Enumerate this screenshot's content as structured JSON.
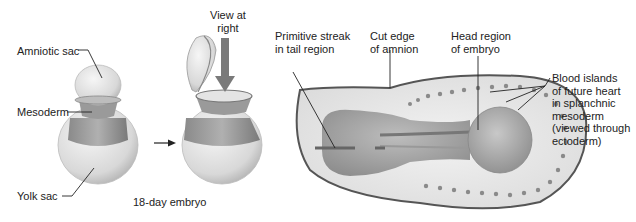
{
  "figure": {
    "left_panel": {
      "labels": {
        "amniotic_sac": "Amniotic sac",
        "mesoderm": "Mesoderm",
        "yolk_sac": "Yolk sac"
      },
      "caption": "18-day embryo",
      "view_label_line1": "View at",
      "view_label_line2": "right"
    },
    "right_panel": {
      "labels": {
        "primitive_streak_line1": "Primitive streak",
        "primitive_streak_line2": "in tail region",
        "cut_edge_line1": "Cut edge",
        "cut_edge_line2": "of amnion",
        "head_region_line1": "Head region",
        "head_region_line2": "of embryo",
        "blood_islands_line1": "Blood islands",
        "blood_islands_line2": "of future heart",
        "blood_islands_line3": "in splanchnic",
        "blood_islands_line4": "mesoderm",
        "blood_islands_line5": "(viewed through",
        "blood_islands_line6": "ectoderm)"
      }
    },
    "colors": {
      "outline": "#555555",
      "sphere_light": "#eeeeee",
      "sphere_dark": "#9a9a9a",
      "mesoderm_band": "#888888",
      "blood_island": "#8a8a8a",
      "arrow": "#777777"
    }
  }
}
